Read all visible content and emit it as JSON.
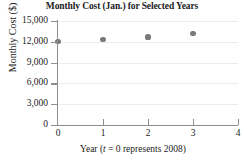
{
  "chart_data": {
    "type": "scatter",
    "title": "Monthly Cost (Jan.) for Selected Years",
    "xlabel_prefix": "Year (",
    "xlabel_italic": "t",
    "xlabel_suffix": " = 0 represents 2008)",
    "xlabel": "Year (t = 0 represents 2008)",
    "ylabel": "Monthly Cost ($)",
    "x": [
      0,
      1,
      2,
      3
    ],
    "values": [
      12000,
      12300,
      12700,
      13200
    ],
    "xlim": [
      0,
      4
    ],
    "ylim": [
      0,
      15000
    ],
    "xticks": [
      "0",
      "1",
      "2",
      "3",
      "4"
    ],
    "xtick_values": [
      0,
      1,
      2,
      3,
      4
    ],
    "yticks": [
      "0",
      "3,000",
      "6,000",
      "9,000",
      "12,000",
      "15,000"
    ],
    "ytick_values": [
      0,
      3000,
      6000,
      9000,
      12000,
      15000
    ],
    "grid": true,
    "legend": null,
    "marker_color": "#7a7a7a",
    "axis_color": "#8e8e8e",
    "grid_color": "#ececec",
    "text_color": "#1b1b1b"
  }
}
